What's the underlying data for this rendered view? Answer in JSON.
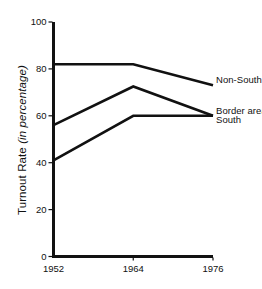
{
  "chart_data": {
    "type": "line",
    "title": "",
    "subtitle": "",
    "xlabel": "",
    "ylabel": "Turnout Rate (in percentage)",
    "ylabel_plain": "Turnout Rate",
    "ylabel_italic": "(in percentage)",
    "x": [
      "1952",
      "1964",
      "1976"
    ],
    "categories": [
      "1952",
      "1964",
      "1976"
    ],
    "xtick_labels": [
      "1952",
      "1964",
      "1976"
    ],
    "ytick_labels": [
      "0",
      "20",
      "40",
      "60",
      "80",
      "100"
    ],
    "ytick_values": [
      0,
      20,
      40,
      60,
      80,
      100
    ],
    "ylim": [
      0,
      100
    ],
    "grid": false,
    "legend_position": "right-inline",
    "line_color": "#111111",
    "series": [
      {
        "name": "Non-South",
        "label": "Non-South",
        "values": [
          82,
          82,
          73
        ]
      },
      {
        "name": "Border area",
        "label": "Border area",
        "values": [
          56,
          72.5,
          60
        ]
      },
      {
        "name": "South",
        "label": "South",
        "values": [
          41,
          60,
          60
        ]
      }
    ]
  },
  "axes": {
    "y_axis_name": "y-axis",
    "x_axis_name": "x-axis"
  }
}
